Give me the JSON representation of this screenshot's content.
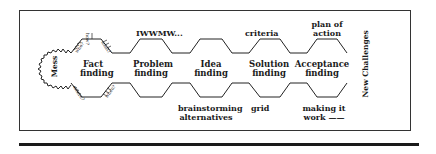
{
  "diagram": {
    "start": "Mess",
    "end": "New Challenges",
    "questions": {
      "top_vertical": "how?",
      "top_left": "who?",
      "top_right": "what?",
      "bottom_left": "where?",
      "bottom_right": "when?"
    },
    "stages": [
      {
        "name": "Fact finding",
        "line1": "Fact",
        "line2": "finding"
      },
      {
        "name": "Problem finding",
        "line1": "Problem",
        "line2": "finding"
      },
      {
        "name": "Idea finding",
        "line1": "Idea",
        "line2": "finding"
      },
      {
        "name": "Solution finding",
        "line1": "Solution",
        "line2": "finding"
      },
      {
        "name": "Acceptance finding",
        "line1": "Acceptance",
        "line2": "finding"
      }
    ],
    "top_notes": {
      "problem": "IWWMW...",
      "solution": "criteria",
      "acceptance_line1": "plan of",
      "acceptance_line2": "action"
    },
    "bottom_notes": {
      "idea_line1": "brainstorming",
      "idea_line2": "alternatives",
      "solution": "grid",
      "acceptance_line1": "making it",
      "acceptance_line2": "work ——"
    }
  }
}
